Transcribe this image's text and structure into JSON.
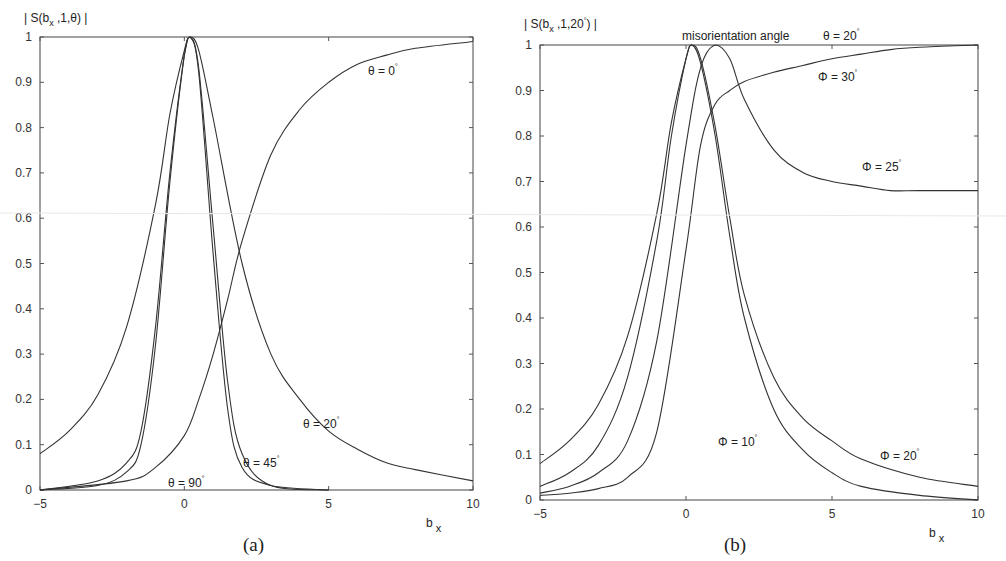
{
  "chart_data": [
    {
      "type": "line",
      "panel": "(a)",
      "ylabel": "| S(b_x ,1,θ) |",
      "xlabel": "b_x",
      "xlim": [
        -5,
        10
      ],
      "ylim": [
        0,
        1
      ],
      "xticks": [
        "-5",
        "0",
        "5",
        "10"
      ],
      "yticks": [
        "0",
        "0.1",
        "0.2",
        "0.3",
        "0.4",
        "0.5",
        "0.6",
        "0.7",
        "0.8",
        "0.9",
        "1"
      ],
      "grid": false,
      "legend": "inline annotations",
      "series": [
        {
          "name": "θ = 0°",
          "x": [
            -5,
            -2,
            -1,
            0,
            0.5,
            1,
            1.5,
            2,
            3,
            4,
            5,
            6,
            7,
            8,
            10
          ],
          "values": [
            0,
            0.02,
            0.05,
            0.12,
            0.2,
            0.3,
            0.42,
            0.55,
            0.74,
            0.84,
            0.9,
            0.94,
            0.96,
            0.975,
            0.99
          ]
        },
        {
          "name": "θ = 20°",
          "x": [
            -5,
            -4,
            -3,
            -2,
            -1,
            -0.5,
            0,
            0.2,
            0.5,
            1,
            2,
            3,
            4,
            5,
            6,
            7,
            8,
            10
          ],
          "values": [
            0.08,
            0.13,
            0.21,
            0.36,
            0.63,
            0.83,
            0.97,
            1,
            0.97,
            0.82,
            0.5,
            0.3,
            0.2,
            0.13,
            0.09,
            0.06,
            0.045,
            0.02
          ]
        },
        {
          "name": "θ = 45°",
          "x": [
            -5,
            -3,
            -2,
            -1.5,
            -1,
            -0.5,
            0,
            0.2,
            0.5,
            1,
            1.5,
            2,
            3,
            5
          ],
          "values": [
            0,
            0.01,
            0.04,
            0.1,
            0.32,
            0.68,
            0.96,
            1,
            0.93,
            0.58,
            0.24,
            0.08,
            0.01,
            0
          ]
        },
        {
          "name": "θ = 90°",
          "x": [
            -5,
            -3,
            -2,
            -1.5,
            -1,
            -0.5,
            0,
            0.2,
            0.5,
            1,
            1.5,
            2,
            3,
            5
          ],
          "values": [
            0,
            0.02,
            0.06,
            0.13,
            0.36,
            0.7,
            0.96,
            1,
            0.92,
            0.52,
            0.18,
            0.05,
            0.01,
            0
          ]
        }
      ],
      "annotations": [
        "θ = 0°",
        "θ = 20°",
        "θ = 45°",
        "θ = 90°"
      ]
    },
    {
      "type": "line",
      "panel": "(b)",
      "title": "misorientation angle   θ = 20°",
      "ylabel": "| S(b_x ,1,20°) |",
      "xlabel": "b_x",
      "xlim": [
        -5,
        10
      ],
      "ylim": [
        0,
        1
      ],
      "xticks": [
        "-5",
        "0",
        "5",
        "10"
      ],
      "yticks": [
        "0",
        "0.1",
        "0.2",
        "0.3",
        "0.4",
        "0.5",
        "0.6",
        "0.7",
        "0.8",
        "0.9",
        "1"
      ],
      "grid": false,
      "legend": "inline annotations",
      "series": [
        {
          "name": "Φ = 10°",
          "x": [
            -5,
            -4,
            -3,
            -2,
            -1,
            -0.5,
            0,
            0.2,
            0.5,
            1,
            1.5,
            2,
            3,
            4,
            5,
            6,
            8,
            10
          ],
          "values": [
            0.08,
            0.13,
            0.21,
            0.36,
            0.63,
            0.83,
            0.97,
            1,
            0.96,
            0.8,
            0.58,
            0.4,
            0.2,
            0.11,
            0.06,
            0.03,
            0.01,
            0
          ]
        },
        {
          "name": "Φ = 20°",
          "x": [
            -5,
            -4,
            -3,
            -2,
            -1,
            -0.5,
            0,
            0.2,
            0.5,
            1,
            1.5,
            2,
            3,
            4,
            5,
            6,
            8,
            10
          ],
          "values": [
            0.03,
            0.06,
            0.12,
            0.27,
            0.57,
            0.8,
            0.97,
            1,
            0.97,
            0.82,
            0.62,
            0.45,
            0.27,
            0.18,
            0.13,
            0.09,
            0.05,
            0.03
          ]
        },
        {
          "name": "Φ = 25°",
          "x": [
            -5,
            -4,
            -3,
            -2,
            -1,
            0,
            0.5,
            1,
            1.5,
            2,
            3,
            4,
            5,
            6,
            7,
            8,
            10
          ],
          "values": [
            0.015,
            0.03,
            0.06,
            0.13,
            0.35,
            0.78,
            0.95,
            1,
            0.97,
            0.88,
            0.77,
            0.72,
            0.7,
            0.69,
            0.68,
            0.68,
            0.68
          ]
        },
        {
          "name": "Φ = 30°",
          "x": [
            -5,
            -4,
            -3,
            -2,
            -1,
            0,
            0.5,
            1,
            1.5,
            2,
            3,
            4,
            5,
            6,
            7,
            8,
            10
          ],
          "values": [
            0.01,
            0.015,
            0.025,
            0.05,
            0.15,
            0.55,
            0.78,
            0.87,
            0.9,
            0.92,
            0.94,
            0.955,
            0.97,
            0.98,
            0.99,
            0.995,
            1
          ]
        }
      ],
      "annotations": [
        "Φ = 10°",
        "Φ = 20°",
        "Φ = 25°",
        "Φ = 30°",
        "misorientation angle",
        "θ = 20°"
      ]
    }
  ],
  "panels": {
    "a": {
      "caption": "(a)",
      "ylabel_main": "| S(b",
      "ylabel_sub": "x",
      "ylabel_rest": " ,1,θ) |",
      "xlabel_main": "b",
      "xlabel_sub": "x",
      "xticks": [
        "−5",
        "0",
        "5",
        "10"
      ],
      "yticks": [
        "0",
        "0.1",
        "0.2",
        "0.3",
        "0.4",
        "0.5",
        "0.6",
        "0.7",
        "0.8",
        "0.9",
        "1"
      ],
      "labels": {
        "t0": "θ = 0",
        "t20": "θ = 20",
        "t45": "θ = 45",
        "t90": "θ = 90"
      },
      "deg": "°"
    },
    "b": {
      "caption": "(b)",
      "ylabel_main": "| S(b",
      "ylabel_sub": "x",
      "ylabel_rest": " ,1,20",
      "ylabel_deg": "°",
      "ylabel_end": ") |",
      "xlabel_main": "b",
      "xlabel_sub": "x",
      "xticks": [
        "−5",
        "0",
        "5",
        "10"
      ],
      "yticks": [
        "0",
        "0.1",
        "0.2",
        "0.3",
        "0.4",
        "0.5",
        "0.6",
        "0.7",
        "0.8",
        "0.9",
        "1"
      ],
      "title_left": "misorientation angle",
      "title_right": "θ = 20",
      "labels": {
        "p10": "Φ = 10",
        "p20": "Φ = 20",
        "p25": "Φ = 25",
        "p30": "Φ = 30"
      },
      "deg": "°"
    }
  }
}
